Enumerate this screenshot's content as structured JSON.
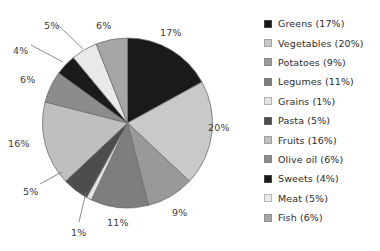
{
  "chart_data": {
    "type": "pie",
    "title": "",
    "subtitle": "",
    "xlabel": "",
    "ylabel": "",
    "legend_position": "right",
    "grid": false,
    "start_angle_deg": 0,
    "direction": "clockwise",
    "categories": [
      "Greens",
      "Vegetables",
      "Potatoes",
      "Legumes",
      "Grains",
      "Pasta",
      "Fruits",
      "Olive oil",
      "Sweets",
      "Meat",
      "Fish"
    ],
    "values": [
      17,
      20,
      9,
      11,
      1,
      5,
      16,
      6,
      4,
      5,
      6
    ],
    "unit": "%",
    "colors": [
      "#1a1a1a",
      "#c9c9c9",
      "#999999",
      "#7e7e7e",
      "#e2e2e2",
      "#4d4d4d",
      "#bfbfbf",
      "#8c8c8c",
      "#1a1a1a",
      "#e9e9e9",
      "#a6a6a6"
    ],
    "slices": [
      {
        "name": "Greens",
        "value": 17,
        "label": "17%",
        "color": "#1a1a1a",
        "legend_text": "Greens (17%)"
      },
      {
        "name": "Vegetables",
        "value": 20,
        "label": "20%",
        "color": "#c9c9c9",
        "legend_text": "Vegetables (20%)"
      },
      {
        "name": "Potatoes",
        "value": 9,
        "label": "9%",
        "color": "#999999",
        "legend_text": "Potatoes (9%)"
      },
      {
        "name": "Legumes",
        "value": 11,
        "label": "11%",
        "color": "#7e7e7e",
        "legend_text": "Legumes (11%)"
      },
      {
        "name": "Grains",
        "value": 1,
        "label": "1%",
        "color": "#e2e2e2",
        "legend_text": "Grains (1%)"
      },
      {
        "name": "Pasta",
        "value": 5,
        "label": "5%",
        "color": "#4d4d4d",
        "legend_text": "Pasta (5%)"
      },
      {
        "name": "Fruits",
        "value": 16,
        "label": "16%",
        "color": "#bfbfbf",
        "legend_text": "Fruits (16%)"
      },
      {
        "name": "Olive oil",
        "value": 6,
        "label": "6%",
        "color": "#8c8c8c",
        "legend_text": "Olive oil (6%)"
      },
      {
        "name": "Sweets",
        "value": 4,
        "label": "4%",
        "color": "#1a1a1a",
        "legend_text": "Sweets (4%)"
      },
      {
        "name": "Meat",
        "value": 5,
        "label": "5%",
        "color": "#e9e9e9",
        "legend_text": "Meat (5%)"
      },
      {
        "name": "Fish",
        "value": 6,
        "label": "6%",
        "color": "#a6a6a6",
        "legend_text": "Fish (6%)"
      }
    ]
  },
  "geometry": {
    "cx": 127.5,
    "cy": 123,
    "r": 85,
    "stroke": "#6e6e6e"
  },
  "labels": [
    {
      "text": "17%",
      "x": 160,
      "y": 27,
      "leader": false
    },
    {
      "text": "20%",
      "x": 208,
      "y": 122,
      "leader": false
    },
    {
      "text": "9%",
      "x": 172,
      "y": 207,
      "leader": false
    },
    {
      "text": "11%",
      "x": 107,
      "y": 217,
      "leader": false
    },
    {
      "text": "1%",
      "x": 71,
      "y": 227,
      "leader": true,
      "lx1": 79,
      "ly1": 222,
      "lx2": 86,
      "ly2": 192
    },
    {
      "text": "5%",
      "x": 23,
      "y": 186,
      "leader": true,
      "lx1": 40,
      "ly1": 184,
      "lx2": 62,
      "ly2": 172
    },
    {
      "text": "16%",
      "x": 8,
      "y": 138,
      "leader": false
    },
    {
      "text": "6%",
      "x": 20,
      "y": 74,
      "leader": false
    },
    {
      "text": "4%",
      "x": 13,
      "y": 45,
      "leader": true,
      "lx1": 31,
      "ly1": 45,
      "lx2": 63,
      "ly2": 62
    },
    {
      "text": "5%",
      "x": 44,
      "y": 20,
      "leader": true,
      "lx1": 57,
      "ly1": 24,
      "lx2": 83,
      "ly2": 49
    },
    {
      "text": "6%",
      "x": 96,
      "y": 20,
      "leader": false
    }
  ],
  "legend": {
    "items": [
      {
        "label": "Greens (17%)",
        "color": "#1a1a1a"
      },
      {
        "label": "Vegetables (20%)",
        "color": "#c9c9c9"
      },
      {
        "label": "Potatoes (9%)",
        "color": "#999999"
      },
      {
        "label": "Legumes (11%)",
        "color": "#7e7e7e"
      },
      {
        "label": "Grains (1%)",
        "color": "#e2e2e2"
      },
      {
        "label": "Pasta (5%)",
        "color": "#4d4d4d"
      },
      {
        "label": "Fruits (16%)",
        "color": "#bfbfbf"
      },
      {
        "label": "Olive oil (6%)",
        "color": "#8c8c8c"
      },
      {
        "label": "Sweets (4%)",
        "color": "#1a1a1a"
      },
      {
        "label": "Meat (5%)",
        "color": "#e9e9e9"
      },
      {
        "label": "Fish (6%)",
        "color": "#a6a6a6"
      }
    ]
  }
}
